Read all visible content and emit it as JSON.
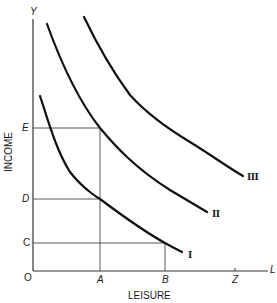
{
  "diagram": {
    "title": "",
    "x_axis": {
      "label": "LEISURE",
      "end_symbol": "L",
      "origin": "O"
    },
    "y_axis": {
      "label": "INCOME",
      "end_symbol": "Y"
    },
    "x_ticks": [
      {
        "label": "A",
        "x": 100
      },
      {
        "label": "B",
        "x": 165
      },
      {
        "label": "Z",
        "x": 235
      }
    ],
    "y_ticks": [
      {
        "label": "E",
        "y": 128
      },
      {
        "label": "D",
        "y": 199
      },
      {
        "label": "C",
        "y": 243
      }
    ],
    "curves": [
      {
        "label": "I",
        "name": "indifference-curve-1"
      },
      {
        "label": "II",
        "name": "indifference-curve-2"
      },
      {
        "label": "III",
        "name": "indifference-curve-3"
      }
    ],
    "guide_lines": [
      "E horizontal to A, vertical A up to curve II",
      "D horizontal to curve I at A",
      "C horizontal to curve I at B, vertical B"
    ]
  }
}
